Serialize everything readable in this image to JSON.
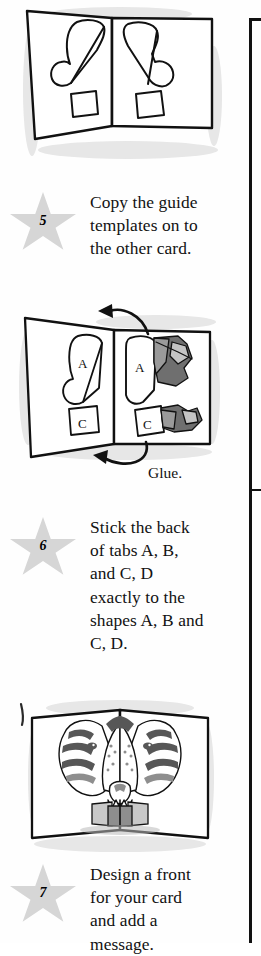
{
  "page": {
    "background_color": "#fefefe",
    "ink_color": "#111111",
    "star_color": "#d6d6d6",
    "rule_color": "#111111"
  },
  "steps": [
    {
      "number": "5",
      "text": "Copy the guide templates on to the other card.",
      "illustration": {
        "name": "open-card-with-guide-templates",
        "description": "An open greeting card seen at an angle with a curved teardrop guide template and a small square tab outlined on each half.",
        "labels": []
      }
    },
    {
      "number": "6",
      "text": "Stick the back of tabs A, B, and C, D exactly to the shapes A, B and C, D.",
      "caption": "Glue.",
      "illustration": {
        "name": "gluing-tabs-to-shapes",
        "description": "Open card with guide shape A and tab square C drawn on the left half, and torn grey paper pieces being glued over matching shapes A and C on the right half. Two curved arrows show the transfer direction.",
        "labels": [
          "A",
          "A",
          "C",
          "C"
        ]
      }
    },
    {
      "number": "7",
      "text": "Design a front for your card and add a message.",
      "illustration": {
        "name": "finished-popup-tiger-card",
        "description": "The finished open card standing up, showing a grey striped tiger face pop-up with ears, eyes, muzzle and teeth rising from the fold.",
        "labels": []
      }
    }
  ]
}
